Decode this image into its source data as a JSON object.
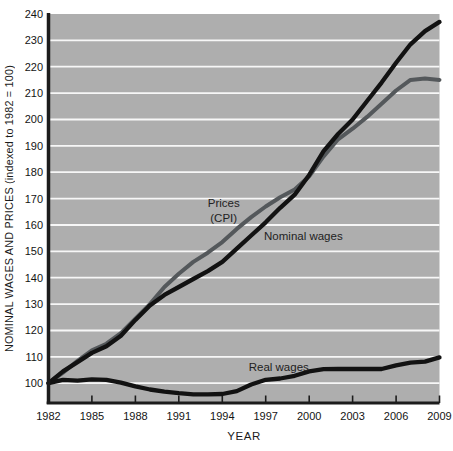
{
  "chart_data": {
    "type": "line",
    "title": "",
    "x": {
      "label": "YEAR",
      "min": 1982,
      "max": 2009,
      "ticks": [
        1982,
        1985,
        1988,
        1991,
        1994,
        1997,
        2000,
        2003,
        2006,
        2009
      ]
    },
    "y": {
      "label": "NOMINAL WAGES AND PRICES (indexed to 1982 = 100)",
      "min": 92.5,
      "max": 240,
      "ticks": [
        100,
        110,
        120,
        130,
        140,
        150,
        160,
        170,
        180,
        190,
        200,
        210,
        220,
        230,
        240
      ],
      "gridlines": [
        100,
        110,
        120,
        130,
        140,
        150,
        160,
        170,
        180,
        190,
        200,
        210,
        220,
        230
      ]
    },
    "years": [
      1982,
      1983,
      1984,
      1985,
      1986,
      1987,
      1988,
      1989,
      1990,
      1991,
      1992,
      1993,
      1994,
      1995,
      1996,
      1997,
      1998,
      1999,
      2000,
      2001,
      2002,
      2003,
      2004,
      2005,
      2006,
      2007,
      2008,
      2009
    ],
    "series": [
      {
        "name": "Prices (CPI)",
        "color": "#54585b",
        "width": 4,
        "values": [
          100,
          104,
          108.5,
          112.5,
          115,
          119,
          124.5,
          130,
          136.5,
          141.5,
          146,
          149.5,
          153.5,
          158.5,
          163,
          167,
          170.5,
          173.5,
          178.5,
          186,
          192.5,
          196.5,
          201,
          206,
          211,
          215,
          215.5,
          215
        ]
      },
      {
        "name": "Nominal wages",
        "color": "#121212",
        "width": 4.3,
        "values": [
          100,
          104.5,
          108,
          111.5,
          114,
          118,
          124,
          129.5,
          133.5,
          136.5,
          139.5,
          142.5,
          146,
          151,
          156,
          161,
          166.5,
          171.5,
          179,
          188,
          194.5,
          200,
          207,
          214,
          221.5,
          228.5,
          233.5,
          237
        ]
      },
      {
        "name": "Real wages",
        "color": "#121212",
        "width": 4.3,
        "values": [
          100,
          101.3,
          101,
          101.5,
          101.3,
          100.2,
          98.8,
          97.6,
          96.8,
          96.2,
          95.8,
          95.8,
          95.9,
          97,
          99.5,
          101.3,
          101.8,
          102.8,
          104.5,
          105.3,
          105.4,
          105.4,
          105.4,
          105.4,
          106.8,
          107.8,
          108.2,
          109.8
        ]
      }
    ],
    "annotations": [
      {
        "text": "Prices\n(CPI)",
        "x": 1994.1,
        "y": 165.5
      },
      {
        "text": "Nominal wages",
        "x": 1999.6,
        "y": 155.9
      },
      {
        "text": "Real wages",
        "x": 1997.9,
        "y": 106.3
      }
    ],
    "colors": {
      "plot_bg": "#aeaeae",
      "gridline": "#f7f7f7",
      "axis": "#1c1c1c",
      "text": "#141414"
    },
    "legend": "none (labels drawn inline next to lines)"
  }
}
